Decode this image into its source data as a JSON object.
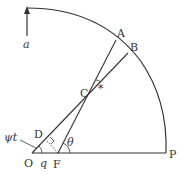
{
  "diagram": {
    "points": {
      "O": {
        "label": "O",
        "x": 32,
        "y": 153
      },
      "F": {
        "label": "F",
        "x": 58,
        "y": 153
      },
      "P": {
        "label": "P",
        "x": 166,
        "y": 153
      },
      "A": {
        "label": "A",
        "x": 116,
        "y": 40
      },
      "B": {
        "label": "B",
        "x": 128,
        "y": 53
      },
      "C": {
        "label": "C",
        "x": 92,
        "y": 91
      },
      "D": {
        "label": "D",
        "x": 46,
        "y": 141
      }
    },
    "labels": {
      "a": "a",
      "psi_t": "ψt",
      "q": "q",
      "theta": "θ",
      "star": "*"
    },
    "colors": {
      "line": "#333333",
      "background": "#ffffff"
    }
  }
}
